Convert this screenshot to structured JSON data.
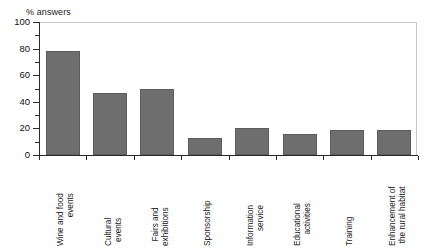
{
  "chart_data": {
    "type": "bar",
    "title": "",
    "ylabel": "% answers",
    "xlabel": "",
    "ylim": [
      0,
      100
    ],
    "yticks": [
      0,
      20,
      40,
      60,
      80,
      100
    ],
    "ytick_labels": [
      "0",
      "20",
      "40",
      "60",
      "80",
      "100"
    ],
    "minor_tick_interval": 10,
    "grid": false,
    "legend": null,
    "bar_color": "#6e6e6e",
    "categories": [
      "Wine and food events",
      "Cultural events",
      "Fairs and exhibitions",
      "Sponsorship",
      "Information service",
      "Educational activities",
      "Training",
      "Enhancement of the rural habitat"
    ],
    "category_lines": [
      [
        "Wine and food",
        "events"
      ],
      [
        "Cultural",
        "events"
      ],
      [
        "Fairs and",
        "exhibitions"
      ],
      [
        "Sponsorship"
      ],
      [
        "Information",
        "service"
      ],
      [
        "Educational",
        "activities"
      ],
      [
        "Training"
      ],
      [
        "Enhancement of",
        "the rural habitat"
      ]
    ],
    "values": [
      78,
      47,
      50,
      13,
      20,
      16,
      19,
      19
    ]
  }
}
